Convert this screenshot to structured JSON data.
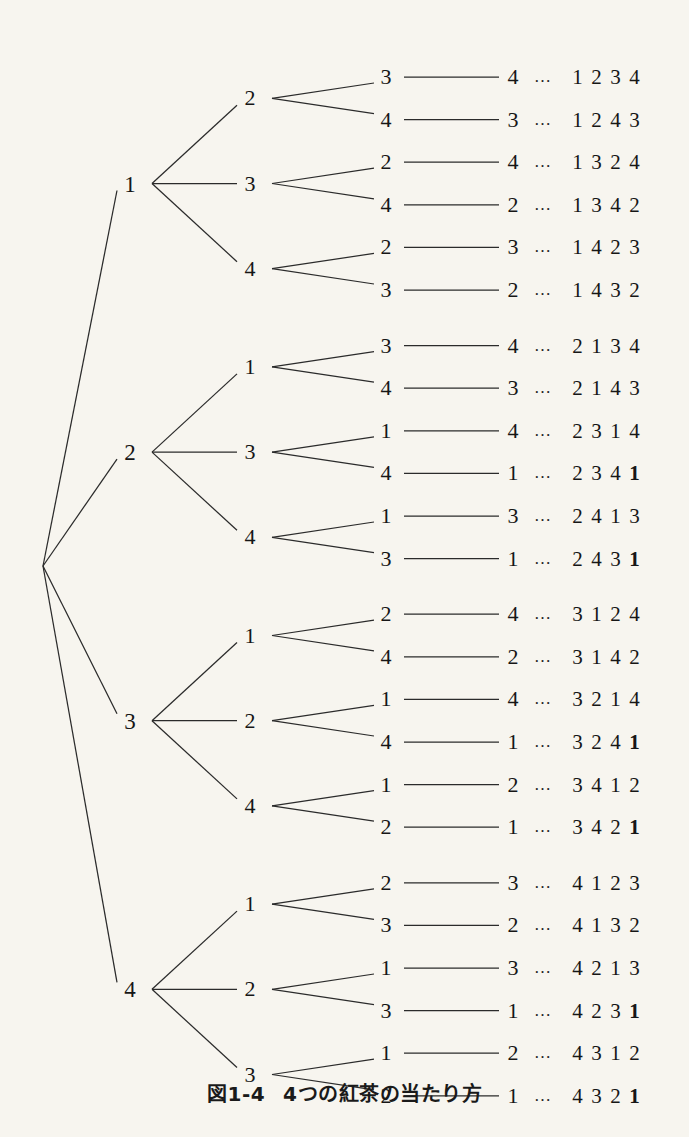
{
  "figure": {
    "caption_label": "図1-4",
    "caption_title": "4つの紅茶の当たり方",
    "root_label": "",
    "background_color": "#f7f5ef",
    "line_color": "#2b2b2b",
    "text_color": "#161616",
    "ellipsis": "…"
  },
  "tree": {
    "level1": [
      {
        "label": "1"
      },
      {
        "label": "2"
      },
      {
        "label": "3"
      },
      {
        "label": "4"
      }
    ],
    "level2": [
      {
        "label": "2"
      },
      {
        "label": "3"
      },
      {
        "label": "4"
      },
      {
        "label": "1"
      },
      {
        "label": "3"
      },
      {
        "label": "4"
      },
      {
        "label": "1"
      },
      {
        "label": "2"
      },
      {
        "label": "4"
      },
      {
        "label": "1"
      },
      {
        "label": "2"
      },
      {
        "label": "3"
      }
    ],
    "level3": [
      {
        "label": "3"
      },
      {
        "label": "4"
      },
      {
        "label": "2"
      },
      {
        "label": "4"
      },
      {
        "label": "2"
      },
      {
        "label": "3"
      },
      {
        "label": "3"
      },
      {
        "label": "4"
      },
      {
        "label": "1"
      },
      {
        "label": "4"
      },
      {
        "label": "1"
      },
      {
        "label": "3"
      },
      {
        "label": "2"
      },
      {
        "label": "4"
      },
      {
        "label": "1"
      },
      {
        "label": "4"
      },
      {
        "label": "1"
      },
      {
        "label": "2"
      },
      {
        "label": "2"
      },
      {
        "label": "3"
      },
      {
        "label": "1"
      },
      {
        "label": "3"
      },
      {
        "label": "1"
      },
      {
        "label": "2"
      }
    ],
    "level4": [
      {
        "label": "4"
      },
      {
        "label": "3"
      },
      {
        "label": "4"
      },
      {
        "label": "2"
      },
      {
        "label": "3"
      },
      {
        "label": "2"
      },
      {
        "label": "4"
      },
      {
        "label": "3"
      },
      {
        "label": "4"
      },
      {
        "label": "1"
      },
      {
        "label": "3"
      },
      {
        "label": "1"
      },
      {
        "label": "4"
      },
      {
        "label": "2"
      },
      {
        "label": "4"
      },
      {
        "label": "1"
      },
      {
        "label": "2"
      },
      {
        "label": "1"
      },
      {
        "label": "3"
      },
      {
        "label": "2"
      },
      {
        "label": "3"
      },
      {
        "label": "1"
      },
      {
        "label": "2"
      },
      {
        "label": "1"
      }
    ],
    "permutations": [
      {
        "digits": [
          "1",
          "2",
          "3",
          "4"
        ],
        "bold": [
          false,
          false,
          false,
          false
        ]
      },
      {
        "digits": [
          "1",
          "2",
          "4",
          "3"
        ],
        "bold": [
          false,
          false,
          false,
          false
        ]
      },
      {
        "digits": [
          "1",
          "3",
          "2",
          "4"
        ],
        "bold": [
          false,
          false,
          false,
          false
        ]
      },
      {
        "digits": [
          "1",
          "3",
          "4",
          "2"
        ],
        "bold": [
          false,
          false,
          false,
          false
        ]
      },
      {
        "digits": [
          "1",
          "4",
          "2",
          "3"
        ],
        "bold": [
          false,
          false,
          false,
          false
        ]
      },
      {
        "digits": [
          "1",
          "4",
          "3",
          "2"
        ],
        "bold": [
          false,
          false,
          false,
          false
        ]
      },
      {
        "digits": [
          "2",
          "1",
          "3",
          "4"
        ],
        "bold": [
          false,
          false,
          false,
          false
        ]
      },
      {
        "digits": [
          "2",
          "1",
          "4",
          "3"
        ],
        "bold": [
          false,
          false,
          false,
          false
        ]
      },
      {
        "digits": [
          "2",
          "3",
          "1",
          "4"
        ],
        "bold": [
          false,
          false,
          false,
          false
        ]
      },
      {
        "digits": [
          "2",
          "3",
          "4",
          "1"
        ],
        "bold": [
          false,
          false,
          false,
          true
        ]
      },
      {
        "digits": [
          "2",
          "4",
          "1",
          "3"
        ],
        "bold": [
          false,
          false,
          false,
          false
        ]
      },
      {
        "digits": [
          "2",
          "4",
          "3",
          "1"
        ],
        "bold": [
          false,
          false,
          false,
          true
        ]
      },
      {
        "digits": [
          "3",
          "1",
          "2",
          "4"
        ],
        "bold": [
          false,
          false,
          false,
          false
        ]
      },
      {
        "digits": [
          "3",
          "1",
          "4",
          "2"
        ],
        "bold": [
          false,
          false,
          false,
          false
        ]
      },
      {
        "digits": [
          "3",
          "2",
          "1",
          "4"
        ],
        "bold": [
          false,
          false,
          false,
          false
        ]
      },
      {
        "digits": [
          "3",
          "2",
          "4",
          "1"
        ],
        "bold": [
          false,
          false,
          false,
          true
        ]
      },
      {
        "digits": [
          "3",
          "4",
          "1",
          "2"
        ],
        "bold": [
          false,
          false,
          false,
          false
        ]
      },
      {
        "digits": [
          "3",
          "4",
          "2",
          "1"
        ],
        "bold": [
          false,
          false,
          false,
          true
        ]
      },
      {
        "digits": [
          "4",
          "1",
          "2",
          "3"
        ],
        "bold": [
          false,
          false,
          false,
          false
        ]
      },
      {
        "digits": [
          "4",
          "1",
          "3",
          "2"
        ],
        "bold": [
          false,
          false,
          false,
          false
        ]
      },
      {
        "digits": [
          "4",
          "2",
          "1",
          "3"
        ],
        "bold": [
          false,
          false,
          false,
          false
        ]
      },
      {
        "digits": [
          "4",
          "2",
          "3",
          "1"
        ],
        "bold": [
          false,
          false,
          false,
          true
        ]
      },
      {
        "digits": [
          "4",
          "3",
          "1",
          "2"
        ],
        "bold": [
          false,
          false,
          false,
          false
        ]
      },
      {
        "digits": [
          "4",
          "3",
          "2",
          "1"
        ],
        "bold": [
          false,
          false,
          false,
          true
        ]
      }
    ]
  },
  "chart_data": {
    "type": "diagram",
    "title": "4つの紅茶の当たり方",
    "figure_number": "図1-4",
    "depth": 4,
    "leaf_count": 24,
    "branching": [
      4,
      3,
      2,
      1
    ]
  }
}
